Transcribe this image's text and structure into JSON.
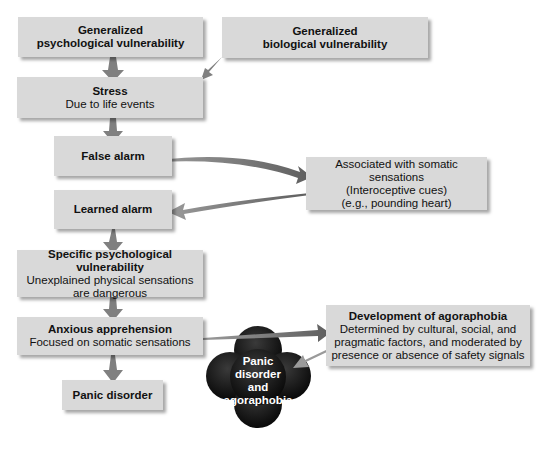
{
  "diagram": {
    "title": "",
    "nodes": {
      "gen_psych": {
        "title": "Generalized",
        "title2": "psychological vulnerability"
      },
      "gen_bio": {
        "title": "Generalized",
        "title2": "biological vulnerability"
      },
      "stress": {
        "title": "Stress",
        "subtitle": "Due to life events"
      },
      "false_alarm": {
        "title": "False alarm"
      },
      "associated": {
        "line1": "Associated with somatic sensations",
        "line2": "(Interoceptive cues)",
        "line3": "(e.g., pounding heart)"
      },
      "learned_alarm": {
        "title": "Learned alarm"
      },
      "specific": {
        "title": "Specific psychological vulnerability",
        "line1": "Unexplained physical sensations",
        "line2": "are dangerous"
      },
      "anxious": {
        "title": "Anxious apprehension",
        "subtitle": "Focused on somatic sensations"
      },
      "panic": {
        "title": "Panic disorder"
      },
      "development": {
        "title": "Development of agoraphobia",
        "line1": "Determined by cultural, social, and",
        "line2": "pragmatic factors, and moderated by",
        "line3": "presence or absence of safety signals"
      },
      "cloud": {
        "line1": "Panic",
        "line2": "disorder",
        "line3": "and",
        "line4": "agoraphobia"
      }
    },
    "colors": {
      "box": "#d9d9d9",
      "arrow": "#7a7a7a",
      "cloud": "#111111"
    }
  }
}
